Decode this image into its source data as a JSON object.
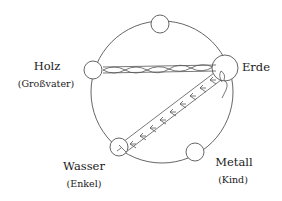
{
  "diagram": {
    "type": "five-elements-cycle",
    "stroke_color": "#555555",
    "text_color": "#1a1a1a",
    "nodes": [
      {
        "id": "top",
        "label": "",
        "sub": ""
      },
      {
        "id": "holz",
        "label": "Holz",
        "sub": "(Großvater)"
      },
      {
        "id": "erde",
        "label": "Erde",
        "sub": ""
      },
      {
        "id": "wasser",
        "label": "Wasser",
        "sub": "(Enkel)"
      },
      {
        "id": "metall",
        "label": "Metall",
        "sub": "(Kind)"
      }
    ],
    "connections": [
      {
        "from": "holz",
        "to": "erde",
        "style": "twisted-double-band"
      },
      {
        "from": "erde",
        "to": "wasser",
        "style": "chevron-double-band"
      }
    ]
  }
}
